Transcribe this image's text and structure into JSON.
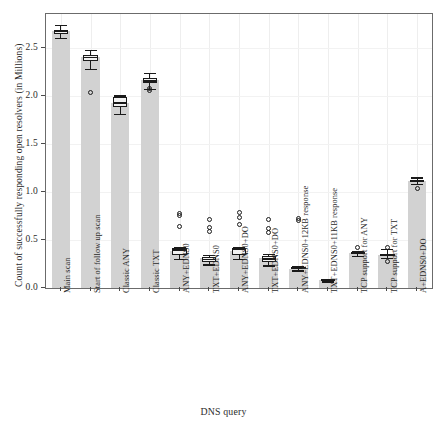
{
  "chart_data": {
    "type": "bar",
    "title": "",
    "xlabel": "DNS query",
    "ylabel": "Count of successfully responding open resolvers (in Millions)",
    "ylim": [
      0.0,
      2.85
    ],
    "yticks": [
      0.0,
      0.5,
      1.0,
      1.5,
      2.0,
      2.5
    ],
    "ytick_labels": [
      "0.0",
      "0.5",
      "1.0",
      "1.5",
      "2.0",
      "2.5"
    ],
    "grid": true,
    "legend": "none",
    "categories": [
      "Main scan",
      "Start of follow up scan",
      "Classic ANY",
      "Classic TXT",
      "ANY+EDNS0",
      "TXT+EDNS0",
      "ANY+EDNS0+DO",
      "TXT+EDNS0+DO",
      "ANY+EDNS0+12KB response",
      "TXT+EDNS0+11KB response",
      "TCP support for ANY",
      "TCP support for TXT",
      "A+EDNS0+DO"
    ],
    "values": [
      2.67,
      2.4,
      1.92,
      2.16,
      0.38,
      0.31,
      0.38,
      0.31,
      0.2,
      0.08,
      0.36,
      0.34,
      1.11
    ],
    "boxplots": [
      {
        "category": "Main scan",
        "whisker_low": 2.6,
        "q1": 2.645,
        "median": 2.665,
        "q3": 2.685,
        "whisker_high": 2.735,
        "outliers": []
      },
      {
        "category": "Start of follow up scan",
        "whisker_low": 2.28,
        "q1": 2.365,
        "median": 2.395,
        "q3": 2.425,
        "whisker_high": 2.475,
        "outliers": [
          2.03
        ]
      },
      {
        "category": "Classic ANY",
        "whisker_low": 1.81,
        "q1": 1.885,
        "median": 1.925,
        "q3": 1.985,
        "whisker_high": 2.005,
        "outliers": []
      },
      {
        "category": "Classic TXT",
        "whisker_low": 2.07,
        "q1": 2.135,
        "median": 2.155,
        "q3": 2.185,
        "whisker_high": 2.235,
        "outliers": [
          2.08,
          2.05
        ]
      },
      {
        "category": "ANY+EDNS0",
        "whisker_low": 0.305,
        "q1": 0.345,
        "median": 0.395,
        "q3": 0.415,
        "whisker_high": 0.425,
        "outliers": [
          0.78,
          0.75,
          0.64
        ]
      },
      {
        "category": "TXT+EDNS0",
        "whisker_low": 0.245,
        "q1": 0.275,
        "median": 0.295,
        "q3": 0.325,
        "whisker_high": 0.345,
        "outliers": [
          0.71,
          0.63,
          0.59
        ]
      },
      {
        "category": "ANY+EDNS0+DO",
        "whisker_low": 0.3,
        "q1": 0.345,
        "median": 0.4,
        "q3": 0.42,
        "whisker_high": 0.425,
        "outliers": [
          0.79,
          0.73,
          0.66
        ]
      },
      {
        "category": "TXT+EDNS0+DO",
        "whisker_low": 0.235,
        "q1": 0.275,
        "median": 0.3,
        "q3": 0.33,
        "whisker_high": 0.355,
        "outliers": [
          0.71,
          0.62,
          0.58
        ]
      },
      {
        "category": "ANY+EDNS0+12KB response",
        "whisker_low": 0.185,
        "q1": 0.195,
        "median": 0.205,
        "q3": 0.215,
        "whisker_high": 0.225,
        "outliers": [
          0.72,
          0.7
        ]
      },
      {
        "category": "TXT+EDNS0+11KB response",
        "whisker_low": 0.07,
        "q1": 0.075,
        "median": 0.082,
        "q3": 0.09,
        "whisker_high": 0.095,
        "outliers": []
      },
      {
        "category": "TCP support for ANY",
        "whisker_low": 0.335,
        "q1": 0.35,
        "median": 0.362,
        "q3": 0.375,
        "whisker_high": 0.385,
        "outliers": [
          0.425
        ]
      },
      {
        "category": "TCP support for TXT",
        "whisker_low": 0.315,
        "q1": 0.33,
        "median": 0.34,
        "q3": 0.35,
        "whisker_high": 0.405,
        "outliers": [
          0.425,
          0.275
        ]
      },
      {
        "category": "A+EDNS0+DO",
        "whisker_low": 1.085,
        "q1": 1.1,
        "median": 1.112,
        "q3": 1.125,
        "whisker_high": 1.15,
        "outliers": [
          1.04
        ]
      }
    ],
    "colors": {
      "bar_fill": "#d2d2d2",
      "box_fill": "#f2f2f2",
      "line": "#1a1a1a",
      "grid": "#eeeeee",
      "frame": "#6b6b6b",
      "text": "#2b2b2b",
      "background": "#ffffff"
    }
  }
}
